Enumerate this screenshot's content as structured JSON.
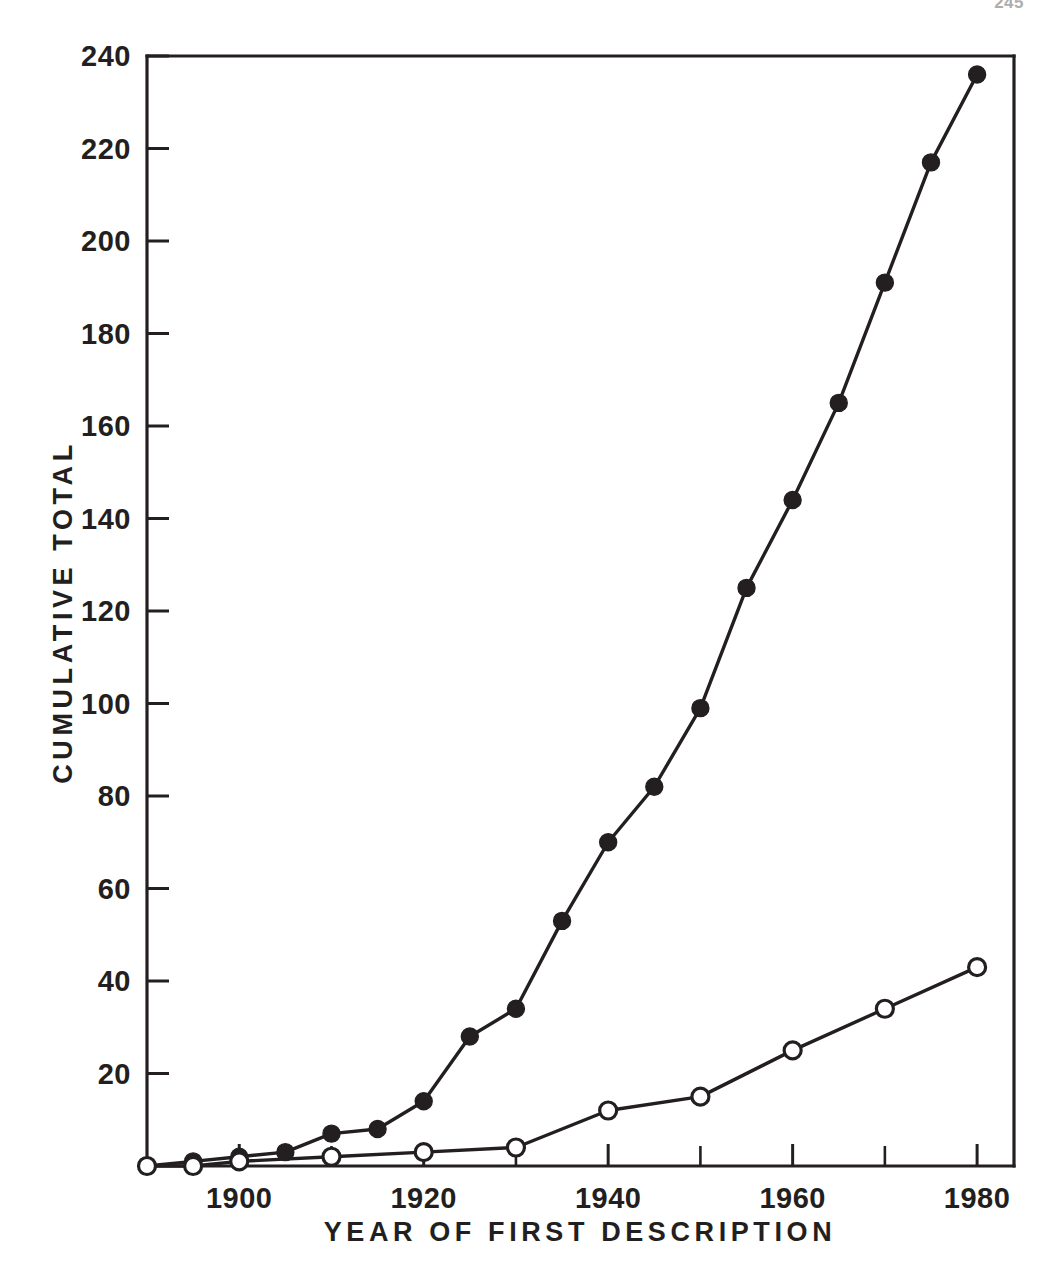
{
  "page": {
    "number": "245"
  },
  "chart_data": {
    "type": "line",
    "title": "",
    "subtitle": "",
    "xlabel": "YEAR  OF  FIRST  DESCRIPTION",
    "ylabel": "CUMULATIVE  TOTAL",
    "xlim": [
      1890,
      1984
    ],
    "ylim": [
      0,
      240
    ],
    "grid": false,
    "legend_position": "none",
    "x_tick_labels": [
      "1900",
      "1920",
      "1940",
      "1960",
      "1980"
    ],
    "x_tick_values": [
      1900,
      1920,
      1940,
      1960,
      1980
    ],
    "x_minor_ticks": [
      1910,
      1930,
      1950,
      1970
    ],
    "y_tick_labels": [
      "20",
      "40",
      "60",
      "80",
      "100",
      "120",
      "140",
      "160",
      "180",
      "200",
      "220",
      "240"
    ],
    "y_tick_values": [
      20,
      40,
      60,
      80,
      100,
      120,
      140,
      160,
      180,
      200,
      220,
      240
    ],
    "series": [
      {
        "name": "filled-circles",
        "marker": "filled-circle",
        "x": [
          1890,
          1895,
          1900,
          1905,
          1910,
          1915,
          1920,
          1925,
          1930,
          1935,
          1940,
          1945,
          1950,
          1955,
          1960,
          1965,
          1970,
          1975,
          1980
        ],
        "values": [
          0,
          1,
          2,
          3,
          7,
          8,
          14,
          28,
          34,
          53,
          70,
          82,
          99,
          125,
          144,
          165,
          191,
          217,
          236
        ]
      },
      {
        "name": "open-circles",
        "marker": "open-circle",
        "x": [
          1890,
          1895,
          1900,
          1910,
          1920,
          1930,
          1940,
          1950,
          1960,
          1970,
          1980
        ],
        "values": [
          0,
          0,
          1,
          2,
          3,
          4,
          12,
          15,
          25,
          34,
          43
        ]
      }
    ],
    "colors": {
      "ink": "#231f20",
      "background": "#ffffff"
    }
  }
}
